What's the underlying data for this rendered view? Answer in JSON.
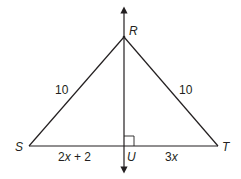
{
  "figure": {
    "type": "isosceles triangle with perpendicular bisector",
    "points": {
      "R": "R",
      "S": "S",
      "T": "T",
      "U": "U"
    },
    "segments": {
      "RS_length": "10",
      "RT_length": "10",
      "SU_length": "2x + 2",
      "UT_length": "3x"
    },
    "marks": {
      "right_angle_at": "U",
      "line_through": "RU",
      "line_arrows": "both ends"
    },
    "colors": {
      "stroke": "#231f20",
      "background": "#ffffff"
    }
  }
}
